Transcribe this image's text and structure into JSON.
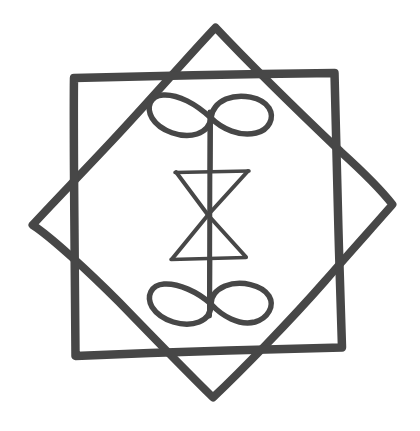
{
  "image": {
    "title": "Hand-drawn eight-pointed star sigil with central glyph",
    "kind": "line-drawing",
    "width": 420,
    "height": 431,
    "background_color": "#ffffff",
    "ink_color": "#474747",
    "ink_color_light": "#555555",
    "medium": "hand-drawn marker on white paper",
    "caption": ""
  },
  "figure": {
    "name": "octagram-sigil",
    "parts": [
      {
        "name": "upright-square",
        "label": "Upright square (slightly tilted)",
        "stroke_width": 8,
        "points": [
          [
            73,
            77
          ],
          [
            335,
            73
          ],
          [
            342,
            348
          ],
          [
            75,
            356
          ]
        ]
      },
      {
        "name": "rotated-square",
        "label": "Rotated square (diamond)",
        "stroke_width": 7,
        "points": [
          [
            215,
            27
          ],
          [
            393,
            205
          ],
          [
            213,
            398
          ],
          [
            32,
            225
          ]
        ]
      },
      {
        "name": "center-staff",
        "label": "Vertical staff",
        "stroke_width": 5,
        "x": 210,
        "y_top": 112,
        "y_bottom": 316
      },
      {
        "name": "top-infinity",
        "label": "Top infinity loop (lemniscate)",
        "center_x": 211,
        "center_y": 117,
        "half_width": 62,
        "half_height": 22
      },
      {
        "name": "bottom-infinity",
        "label": "Bottom infinity loop (lemniscate)",
        "center_x": 211,
        "center_y": 306,
        "half_width": 60,
        "half_height": 22
      },
      {
        "name": "hourglass",
        "label": "Central hourglass (two opposed triangles)",
        "stroke_width": 4,
        "top_left": [
          176,
          172
        ],
        "top_right": [
          248,
          171
        ],
        "waist": [
          208,
          215
        ],
        "bottom_left": [
          172,
          259
        ],
        "bottom_right": [
          246,
          257
        ]
      },
      {
        "name": "hourglass-top-bar",
        "label": "Upper horizontal bar",
        "x1": 175,
        "x2": 249,
        "y": 172
      },
      {
        "name": "hourglass-bottom-bar",
        "label": "Lower horizontal bar",
        "x1": 171,
        "x2": 246,
        "y": 259
      }
    ]
  }
}
